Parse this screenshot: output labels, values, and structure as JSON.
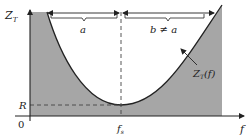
{
  "figure": {
    "y_axis_label": "Z",
    "y_axis_label_sub": "T",
    "x_axis_label": "f",
    "origin_label": "0",
    "r_label": "R",
    "fs_label": "f",
    "fs_label_sub": "s",
    "curve_label": "Z",
    "curve_label_sub": "T",
    "curve_label_arg": "(f)",
    "bracket_a_label": "a",
    "bracket_b_label": "b ≠ a",
    "colors": {
      "fill": "#a6a6a6",
      "curve": "#222222",
      "axes": "#222222",
      "background": "#ffffff"
    }
  }
}
